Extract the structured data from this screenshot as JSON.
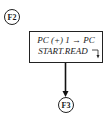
{
  "diagram": {
    "type": "flowchart-fragment",
    "nodes": {
      "entry": {
        "label": "F2"
      },
      "exit": {
        "label": "F3"
      }
    },
    "process_box": {
      "line1": "PC (+) 1 → PC",
      "line2": "START.READ"
    },
    "connections": [
      {
        "from": "F2",
        "to": "process_box"
      },
      {
        "from": "process_box",
        "to": "F3",
        "arrow": true
      }
    ]
  }
}
